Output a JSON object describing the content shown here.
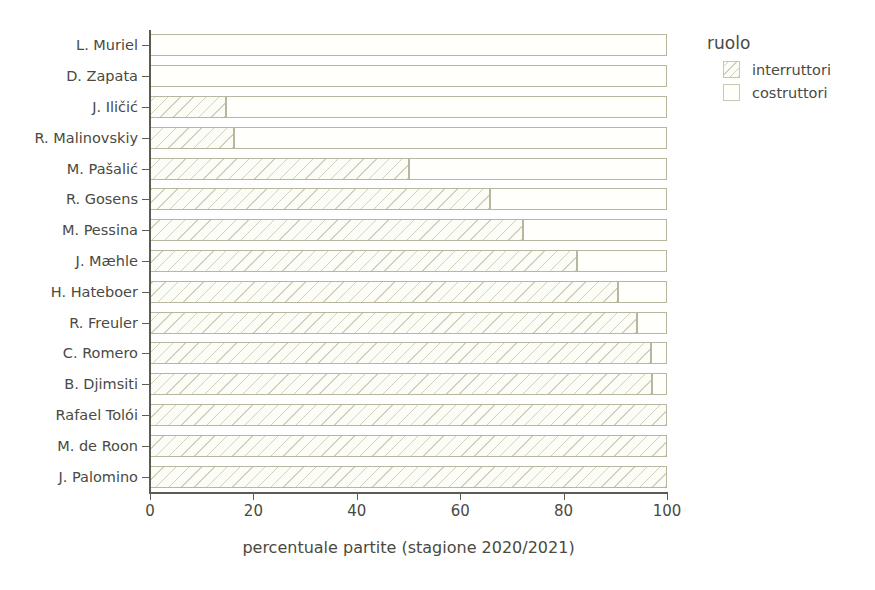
{
  "chart_data": {
    "type": "bar",
    "orientation": "horizontal",
    "stacked": true,
    "title": "",
    "xlabel": "percentuale partite (stagione 2020/2021)",
    "ylabel": "",
    "xlim": [
      0,
      100
    ],
    "xticks": [
      0,
      20,
      40,
      60,
      80,
      100
    ],
    "xtick_labels": [
      "0",
      "20",
      "40",
      "60",
      "80",
      "100"
    ],
    "grid": false,
    "legend_position": "right",
    "legend_title": "ruolo",
    "categories": [
      "L. Muriel",
      "D. Zapata",
      "J. Ilicic",
      "R. Malinovskiy",
      "M. Pasalic",
      "R. Gosens",
      "M. Pessina",
      "J. Maehle",
      "H. Hateboer",
      "R. Freuler",
      "C. Romero",
      "B. Djimsiti",
      "Rafael Toloi",
      "M. de Roon",
      "J. Palomino"
    ],
    "category_labels": [
      "L. Muriel",
      "D. Zapata",
      "J. Iličić",
      "R. Malinovskiy",
      "M. Pašalić",
      "R. Gosens",
      "M. Pessina",
      "J. Mæhle",
      "H. Hateboer",
      "R. Freuler",
      "C. Romero",
      "B. Djimsiti",
      "Rafael Tolói",
      "M. de Roon",
      "J. Palomino"
    ],
    "series": [
      {
        "name": "interruttori",
        "pattern": "diagonal-hatch",
        "values": [
          0,
          0,
          14.7,
          16.2,
          50.1,
          65.8,
          72.2,
          82.6,
          90.5,
          94.2,
          96.9,
          97.1,
          100,
          100,
          100
        ]
      },
      {
        "name": "costruttori",
        "pattern": "solid",
        "values": [
          100,
          100,
          85.3,
          83.8,
          49.9,
          34.2,
          27.8,
          17.4,
          9.5,
          5.8,
          3.1,
          2.9,
          0,
          0,
          0
        ]
      }
    ]
  },
  "legend": {
    "title": "ruolo",
    "items": [
      {
        "label": "interruttori",
        "swatch": "hatched-swatch"
      },
      {
        "label": "costruttori",
        "swatch": "plain-swatch"
      }
    ]
  },
  "colors": {
    "background": "#ffffff",
    "axis": "#5c5c52",
    "text": "#4a4a42",
    "bar_outline": "#b9b6a0",
    "hatch": "#b0ac8c",
    "bar_fill": "#fdfdf7"
  }
}
